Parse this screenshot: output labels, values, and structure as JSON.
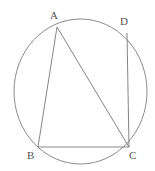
{
  "figure": {
    "name": "cyclic-quadrilateral-diagram",
    "width": 155,
    "height": 171,
    "background_color": "#ffffff",
    "stroke_color": "#777777",
    "label_color": "#555555",
    "stroke_width": 0.9
  },
  "circle": {
    "name": "circumcircle",
    "center_x": 80.5,
    "center_y": 91.5,
    "radius_x": 66.5,
    "radius_y": 72.5
  },
  "points": [
    {
      "id": "A",
      "label": "A",
      "x": 57,
      "y": 27,
      "label_x": 50,
      "label_y": 10
    },
    {
      "id": "D",
      "label": "D",
      "x": 127,
      "y": 33,
      "label_x": 120,
      "label_y": 16
    },
    {
      "id": "B",
      "label": "B",
      "x": 38,
      "y": 147,
      "label_x": 27,
      "label_y": 150
    },
    {
      "id": "C",
      "label": "C",
      "x": 129,
      "y": 147,
      "label_x": 129,
      "label_y": 150
    }
  ],
  "segments": [
    {
      "name": "segment-AB",
      "from": "A",
      "to": "B"
    },
    {
      "name": "segment-AC",
      "from": "A",
      "to": "C"
    },
    {
      "name": "segment-BC",
      "from": "B",
      "to": "C"
    },
    {
      "name": "segment-DC",
      "from": "D",
      "to": "C"
    }
  ],
  "labels": {
    "A": "A",
    "B": "B",
    "C": "C",
    "D": "D"
  }
}
